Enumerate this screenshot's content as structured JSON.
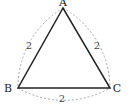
{
  "diagram": {
    "type": "equilateral-triangle-with-arcs",
    "vertices": {
      "A": {
        "label": "A",
        "x": 63,
        "y": 8
      },
      "B": {
        "label": "B",
        "x": 18,
        "y": 88
      },
      "C": {
        "label": "C",
        "x": 110,
        "y": 88
      }
    },
    "side_labels": {
      "AB": "2",
      "AC": "2",
      "BC": "2"
    },
    "colors": {
      "triangle_stroke": "#222222",
      "arc_stroke": "#aaaaaa",
      "background": "#ffffff"
    }
  }
}
